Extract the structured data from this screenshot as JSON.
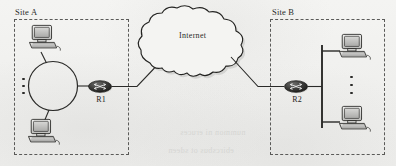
{
  "diagram": {
    "background_color": "#f2f2f0",
    "line_color": "#2a2a28",
    "dashed_border_color": "#5a5a58"
  },
  "sites": [
    {
      "id": "site-a",
      "label": "Site A",
      "topology": "ring",
      "router": {
        "id": "r1",
        "label": "R1"
      },
      "hosts": [
        {
          "id": "site-a-pc-top",
          "icon": "computer-icon"
        },
        {
          "id": "site-a-pc-bottom",
          "icon": "computer-icon"
        }
      ],
      "ellipsis": "vertical-ellipsis"
    },
    {
      "id": "site-b",
      "label": "Site B",
      "topology": "bus",
      "router": {
        "id": "r2",
        "label": "R2"
      },
      "hosts": [
        {
          "id": "site-b-pc-top",
          "icon": "computer-icon"
        },
        {
          "id": "site-b-pc-bottom",
          "icon": "computer-icon"
        }
      ],
      "ellipsis": "vertical-ellipsis"
    }
  ],
  "cloud": {
    "id": "internet-cloud",
    "label": "Internet",
    "icon": "cloud-icon"
  },
  "links": [
    {
      "id": "link-r1-cloud",
      "from": "r1",
      "to": "internet-cloud"
    },
    {
      "id": "link-cloud-r2",
      "from": "internet-cloud",
      "to": "r2"
    }
  ],
  "ghost_text": {
    "line1": "nummon ni eruces",
    "line2": "ebircsbus ot sdeen"
  }
}
